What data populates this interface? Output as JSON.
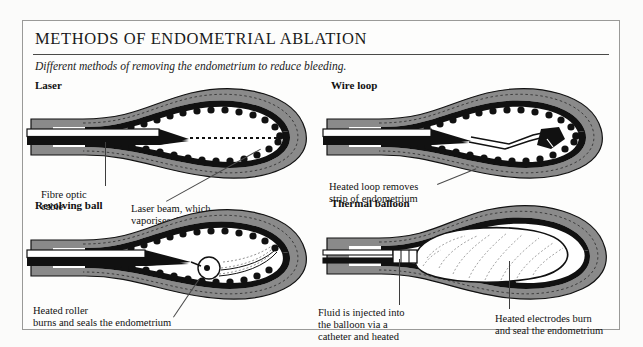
{
  "document": {
    "title": "METHODS OF ENDOMETRIAL ABLATION",
    "subtitle": "Different methods of removing the endometrium to reduce bleeding."
  },
  "colors": {
    "page_background": "#fbfbfa",
    "frame_border": "#9a9a98",
    "myometrium_gray": "#8a8a8a",
    "endometrium_black": "#111111",
    "instrument_white": "#ffffff",
    "text": "#111111",
    "rule": "#4a4a48"
  },
  "panels": [
    {
      "id": "laser",
      "title": "Laser",
      "captions": [
        {
          "id": "fibre-optic-cable",
          "text": "Fibre optic\ncable"
        },
        {
          "id": "laser-beam",
          "text": "Laser beam, which\nvaporises the endometrium"
        }
      ]
    },
    {
      "id": "wire-loop",
      "title": "Wire loop",
      "captions": [
        {
          "id": "heated-loop",
          "text": "Heated loop removes\nstrip of endometrium"
        }
      ]
    },
    {
      "id": "revolving-ball",
      "title": "Revolving ball",
      "captions": [
        {
          "id": "heated-roller",
          "text": "Heated roller\nburns and seals the endometrium"
        }
      ]
    },
    {
      "id": "thermal-balloon",
      "title": "Thermal balloon",
      "captions": [
        {
          "id": "fluid-injected",
          "text": "Fluid is injected into\nthe balloon via a\ncatheter and heated"
        },
        {
          "id": "heated-electrodes",
          "text": "Heated electrodes burn\nand seal the endometrium"
        }
      ]
    }
  ]
}
